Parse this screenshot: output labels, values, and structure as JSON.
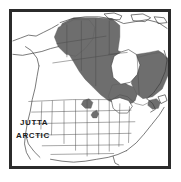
{
  "figure": {
    "kind": "range-map",
    "region": "North America",
    "background_color": "#ffffff",
    "frame_border_color": "#2b2b2b",
    "frame_border_width_px": 3
  },
  "legend": {
    "species_common_name_line1": "JUTTA",
    "species_common_name_line2": "ARCTIC",
    "range_fill_color": "#6e6e6e",
    "outside_range_fill_color": "#ffffff",
    "boundary_line_color": "#3a3a3a"
  },
  "map_data": {
    "type": "choropleth-range",
    "projection": "conic",
    "coastline_color": "#3a3a3a",
    "political_boundary_color": "#4a4a4a",
    "shaded_meaning": "breeding/resident range",
    "unshaded_meaning": "absent",
    "water_bodies": [
      {
        "name": "Hudson Bay",
        "fill": "#ffffff"
      },
      {
        "name": "Great Lakes",
        "fill": "#ffffff"
      },
      {
        "name": "Gulf of Mexico",
        "fill": "#ffffff"
      },
      {
        "name": "Pacific Ocean",
        "fill": "#ffffff"
      },
      {
        "name": "Atlantic Ocean",
        "fill": "#ffffff"
      }
    ],
    "range_polygons": [
      {
        "name": "western-boreal-main",
        "points": "86,6 104,7 112,14 112,26 110,40 118,44 130,44 142,42 152,40 158,44 160,54 156,62 150,66 140,66 134,62 126,60 120,64 118,74 124,80 130,84 128,92 120,96 110,96 100,92 92,86 84,78 76,70 70,62 64,52 58,42 52,32 48,22 52,12 64,6"
      },
      {
        "name": "yukon-bc-northwest",
        "points": "48,16 64,8 80,8 86,16 84,28 76,38 66,46 56,44 48,36 44,26"
      },
      {
        "name": "eastern-quebec-labrador",
        "points": "128,48 142,44 154,42 162,48 162,66 156,80 146,88 136,90 128,84 124,74 124,60"
      },
      {
        "name": "great-lakes-north-ontario",
        "points": "104,76 116,74 126,78 130,86 126,94 116,98 106,96 100,88"
      },
      {
        "name": "rocky-mountain-disjunct-north",
        "points": "74,92 80,90 84,94 82,100 76,100 72,96"
      },
      {
        "name": "rocky-mountain-disjunct-south",
        "points": "84,104 88,102 90,106 88,110 84,110 82,107"
      },
      {
        "name": "maine-northeast-disjunct",
        "points": "142,92 150,90 154,94 152,100 146,101 141,97"
      }
    ],
    "coastlines": [
      {
        "name": "alaska-pacific",
        "path": "M 2,34 L 10,30 L 18,26 L 26,26 L 34,22 L 42,18 L 48,14"
      },
      {
        "name": "alaska-south",
        "path": "M 2,44 L 12,44 L 22,42 L 32,40 L 40,38 L 48,36"
      },
      {
        "name": "pacific-coast-us",
        "path": "M 26,56 L 24,66 L 22,78 L 20,90 L 18,102 L 16,114 L 14,126 L 16,136 L 22,144 L 28,150"
      },
      {
        "name": "gulf-coast",
        "path": "M 62,152 L 74,154 L 86,152 L 98,150 L 110,148 L 120,144"
      },
      {
        "name": "atlantic-coast",
        "path": "M 120,144 L 130,136 L 138,126 L 146,116 L 154,106 L 158,98"
      },
      {
        "name": "hudson-bay",
        "path": "M 112,42 L 120,40 L 128,44 L 132,54 L 130,64 L 124,72 L 114,74 L 106,68 L 104,56 L 106,46 Z"
      },
      {
        "name": "great-lakes",
        "path": "M 104,92 L 112,90 L 120,92 L 124,98 L 120,104 L 112,104 L 106,100 Z"
      },
      {
        "name": "arctic-islands",
        "path": "M 96,6 L 108,4 L 120,6 L 130,10 L 140,8 L 152,10 L 160,16"
      }
    ],
    "internal_boundaries": [
      {
        "name": "us-canada-49th-parallel",
        "path": "M 18,96 L 40,94 L 62,93 L 84,92 L 106,92"
      },
      {
        "name": "state-lines-vertical",
        "paths": [
          "M 40,94 L 40,124",
          "M 54,93 L 54,130",
          "M 68,93 L 68,138",
          "M 82,92 L 82,142",
          "M 96,92 L 96,146",
          "M 110,92 L 110,148",
          "M 124,94 L 124,142"
        ]
      },
      {
        "name": "state-lines-horizontal",
        "paths": [
          "M 20,108 L 124,106",
          "M 22,120 L 126,118",
          "M 26,132 L 122,130",
          "M 34,142 L 116,141"
        ]
      },
      {
        "name": "province-lines",
        "paths": [
          "M 56,14 L 56,46",
          "M 72,10 L 72,60",
          "M 88,8 L 88,76",
          "M 104,10 L 104,44",
          "M 48,34 L 96,26",
          "M 44,52 L 110,44"
        ]
      }
    ]
  }
}
